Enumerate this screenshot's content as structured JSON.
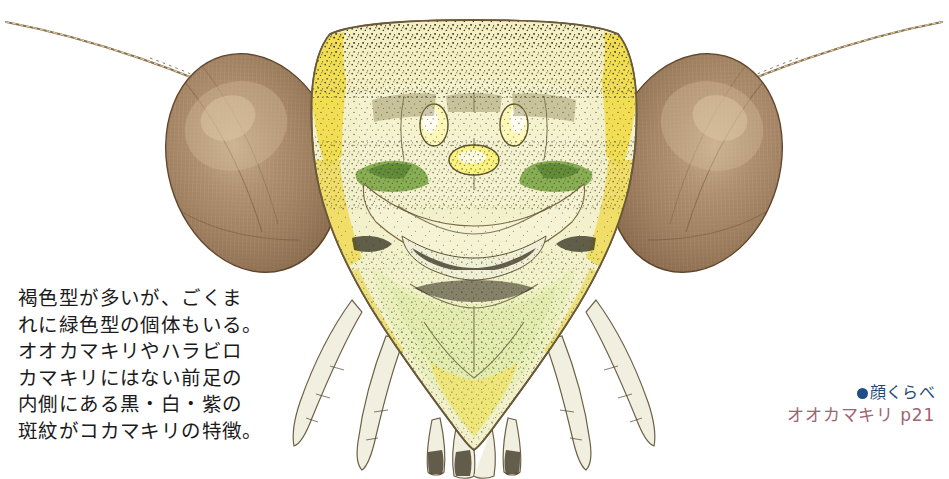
{
  "page": {
    "background_color": "#ffffff",
    "width": 949,
    "height": 479
  },
  "illustration": {
    "name": "mantis-head-frontal-illustration",
    "subject": "コカマキリ",
    "view": "frontal head view",
    "colors": {
      "compound_eye_fill": "#a98a6c",
      "compound_eye_mesh": "#6d4e34",
      "compound_eye_highlight": "#c8ad90",
      "face_pale": "#f2efc9",
      "face_yellow": "#f0dc4e",
      "face_yellow_deep": "#e8cf2a",
      "face_green": "#7fa84a",
      "face_green_dark": "#4d7a30",
      "stipple_dark": "#3a3a28",
      "outline": "#6b5a3a",
      "antenna": "#8a7047",
      "palp_fill": "#efeede"
    },
    "parts": {
      "left_antenna": "left-antenna",
      "right_antenna": "right-antenna",
      "left_compound_eye": "left-compound-eye",
      "right_compound_eye": "right-compound-eye",
      "vertex": "vertex",
      "frons": "frons",
      "ocelli_count": 3,
      "clypeus": "clypeus",
      "labrum": "labrum",
      "mandibles": "mandibles",
      "palps": "maxillary-palps"
    }
  },
  "caption": {
    "lines": [
      "褐色型が多いが、ごくま",
      "れに緑色型の個体もいる。",
      "オオカマキリやハラビロ",
      "カマキリにはない前足の",
      "内側にある黒・白・紫の",
      "斑紋がコカマキリの特徴。"
    ],
    "color": "#1b1b1b"
  },
  "crossref": {
    "bullet_color": "#1f4f86",
    "line1": "顔くらべ",
    "line1_color": "#1f4b75",
    "line2": "オオカマキリ p21",
    "line2_color": "#9d6472"
  }
}
